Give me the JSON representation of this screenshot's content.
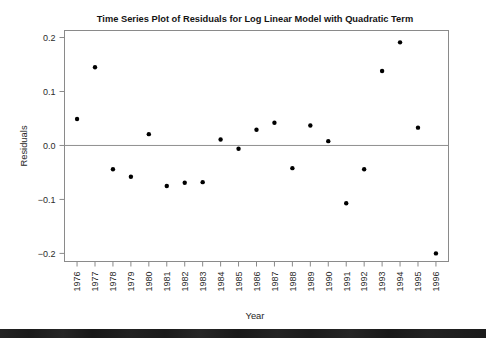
{
  "chart_data": {
    "type": "scatter",
    "title": "Time Series Plot of Residuals for Log Linear Model with Quadratic Term",
    "xlabel": "Year",
    "ylabel": "Residuals",
    "grid": false,
    "legend": null,
    "xlim": [
      1975.3,
      1996.7
    ],
    "ylim": [
      -0.215,
      0.213
    ],
    "xticks": [
      "1976",
      "1977",
      "1978",
      "1979",
      "1980",
      "1981",
      "1982",
      "1983",
      "1984",
      "1985",
      "1986",
      "1987",
      "1988",
      "1989",
      "1990",
      "1991",
      "1992",
      "1993",
      "1994",
      "1995",
      "1996"
    ],
    "yticks": [
      "0.2",
      "0.1",
      "0.0",
      "-0.1",
      "-0.2"
    ],
    "ytick_values": [
      0.2,
      0.1,
      0.0,
      -0.1,
      -0.2
    ],
    "reference_line_y": 0.0,
    "categories": [
      1976,
      1977,
      1978,
      1979,
      1980,
      1981,
      1982,
      1983,
      1984,
      1985,
      1986,
      1987,
      1988,
      1989,
      1990,
      1991,
      1992,
      1993,
      1994,
      1995,
      1996
    ],
    "values": [
      0.049,
      0.145,
      -0.044,
      -0.058,
      0.021,
      -0.075,
      -0.069,
      -0.068,
      0.011,
      -0.006,
      0.029,
      0.042,
      -0.042,
      0.037,
      0.008,
      -0.107,
      -0.044,
      0.138,
      0.191,
      0.033,
      -0.2
    ],
    "point_color": "#000000",
    "axis_color": "#8a8a8a",
    "marker": "filled-circle"
  }
}
